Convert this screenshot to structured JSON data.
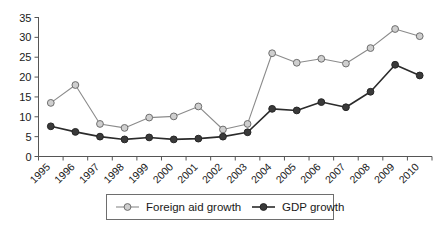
{
  "chart_data": {
    "type": "line",
    "title": "",
    "subtitle": "",
    "xlabel": "",
    "ylabel": "",
    "categories": [
      "1995",
      "1996",
      "1997",
      "1998",
      "1999",
      "2000",
      "2001",
      "2002",
      "2003",
      "2004",
      "2005",
      "2006",
      "2007",
      "2008",
      "2009",
      "2010"
    ],
    "ylim": [
      0,
      35
    ],
    "yticks": [
      0,
      5,
      10,
      15,
      20,
      25,
      30,
      35
    ],
    "ytick_labels": [
      "0",
      "5",
      "10",
      "15",
      "20",
      "25",
      "30",
      "35"
    ],
    "grid": false,
    "legend_position": "bottom",
    "series": [
      {
        "name": "Foreign aid growth",
        "marker": "open-circle",
        "color": "#cfcfcf",
        "line_color": "#8b8b8b",
        "values": [
          13.5,
          18.0,
          8.2,
          7.2,
          9.8,
          10.1,
          12.6,
          6.8,
          8.2,
          26.0,
          23.6,
          24.6,
          23.4,
          27.3,
          32.1,
          30.3
        ]
      },
      {
        "name": "GDP growth",
        "marker": "filled-circle",
        "color": "#3a3a3a",
        "line_color": "#2b2b2b",
        "values": [
          7.6,
          6.2,
          5.0,
          4.3,
          4.8,
          4.3,
          4.5,
          5.0,
          6.1,
          12.0,
          11.6,
          13.7,
          12.4,
          16.3,
          23.1,
          20.4
        ]
      }
    ]
  },
  "legend": {
    "items": [
      {
        "label": "Foreign aid growth"
      },
      {
        "label": "GDP growth"
      }
    ]
  },
  "colors": {
    "axis": "#555555",
    "aid_marker_fill": "#cfcfcf",
    "aid_marker_stroke": "#6e6e6e",
    "aid_line": "#8b8b8b",
    "gdp_marker_fill": "#3a3a3a",
    "gdp_line": "#2b2b2b",
    "background": "#ffffff",
    "text": "#1a1a1a"
  }
}
